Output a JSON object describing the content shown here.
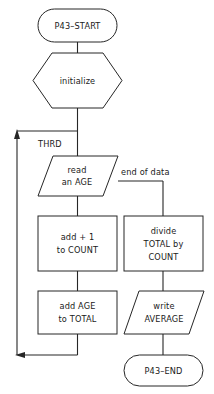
{
  "diagram": {
    "type": "flowchart",
    "line_color": "#262626",
    "fill_color": "#ffffff",
    "background": "#ffffff",
    "nodes": [
      {
        "id": "start",
        "shape": "terminator",
        "lines": [
          "P43–START"
        ]
      },
      {
        "id": "initialize",
        "shape": "preparation-hexagon",
        "lines": [
          "initialize"
        ]
      },
      {
        "id": "read_age",
        "shape": "parallelogram-io",
        "lines": [
          "read",
          "an AGE"
        ]
      },
      {
        "id": "add_count",
        "shape": "process-rectangle",
        "lines": [
          "add + 1",
          "to COUNT"
        ]
      },
      {
        "id": "add_total",
        "shape": "process-rectangle",
        "lines": [
          "add AGE",
          "to TOTAL"
        ]
      },
      {
        "id": "divide",
        "shape": "process-rectangle",
        "lines": [
          "divide",
          "TOTAL by",
          "COUNT"
        ]
      },
      {
        "id": "write_average",
        "shape": "parallelogram-io",
        "lines": [
          "write",
          "AVERAGE"
        ]
      },
      {
        "id": "end",
        "shape": "terminator",
        "lines": [
          "P43–END"
        ]
      }
    ],
    "labels": {
      "loop_label": "THRD",
      "branch_label": "end of data"
    }
  }
}
